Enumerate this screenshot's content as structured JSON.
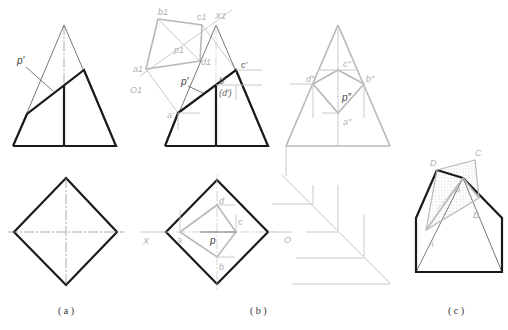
{
  "figure": {
    "panels": [
      {
        "id": "a",
        "caption": "( a )",
        "labels": {
          "plane": "p′"
        }
      },
      {
        "id": "b",
        "caption": "( b )",
        "labels": {
          "b1": "b1",
          "c1": "c1",
          "x1": "X1",
          "p1": "p1",
          "d1": "d1",
          "a1": "a1",
          "o1": "O1",
          "c_prime": "c′",
          "b_prime": "b′",
          "d_prime": "(d′)",
          "p_prime": "p′",
          "a_prime": "a′",
          "d_dbl": "d″",
          "c_dbl": "c″",
          "b_dbl": "b″",
          "p_dbl": "p″",
          "a_dbl": "a″",
          "d": "d",
          "c": "c",
          "a": "a",
          "b": "b",
          "p": "p",
          "x_axis": "X",
          "o_axis": "O"
        }
      },
      {
        "id": "c",
        "caption": "( c )",
        "labels": {
          "D": "D",
          "C": "C",
          "P": "P",
          "B": "B",
          "A": "A"
        }
      }
    ],
    "colors": {
      "primary_line": "#1a1a1a",
      "construction_line": "#b8b8b8",
      "background": "#ffffff"
    }
  }
}
